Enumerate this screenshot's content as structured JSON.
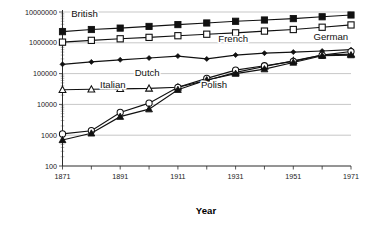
{
  "chart_data": {
    "type": "line",
    "title": "",
    "xlabel": "Year",
    "ylabel": "",
    "yscale": "log",
    "ylim": [
      100,
      10000000
    ],
    "xlim": [
      1871,
      1971
    ],
    "grid": true,
    "legend_position": "inline-labels",
    "x": [
      1871,
      1881,
      1891,
      1901,
      1911,
      1921,
      1931,
      1941,
      1951,
      1961,
      1971
    ],
    "ytick_labels": [
      "100",
      "1000",
      "10000",
      "100000",
      "1000000",
      "10000000"
    ],
    "ytick_values": [
      100,
      1000,
      10000,
      100000,
      1000000,
      10000000
    ],
    "xtick_labels": [
      "1871",
      "1891",
      "1911",
      "1931",
      "1951",
      "1971"
    ],
    "xtick_values": [
      1871,
      1891,
      1911,
      1931,
      1951,
      1971
    ],
    "series": [
      {
        "name": "British",
        "marker": "filled-square",
        "values": [
          2300000,
          2700000,
          3000000,
          3400000,
          3900000,
          4400000,
          5000000,
          5500000,
          6100000,
          7000000,
          8000000
        ]
      },
      {
        "name": "French",
        "marker": "open-square",
        "values": [
          1050000,
          1200000,
          1350000,
          1500000,
          1700000,
          1900000,
          2100000,
          2400000,
          2700000,
          3200000,
          3800000
        ]
      },
      {
        "name": "German",
        "marker": "small-filled-diamond",
        "values": [
          200000,
          240000,
          280000,
          320000,
          370000,
          300000,
          400000,
          460000,
          500000,
          540000,
          600000
        ]
      },
      {
        "name": "Dutch",
        "marker": "open-triangle",
        "values": [
          30000,
          31000,
          32000,
          33000,
          36000,
          60000,
          110000,
          170000,
          260000,
          400000,
          430000
        ]
      },
      {
        "name": "Polish",
        "marker": "open-circle",
        "values": [
          1100,
          1400,
          5500,
          11000,
          36000,
          70000,
          130000,
          180000,
          250000,
          400000,
          520000
        ]
      },
      {
        "name": "Italian",
        "marker": "filled-triangle",
        "values": [
          700,
          1150,
          4000,
          7000,
          30000,
          62000,
          100000,
          140000,
          230000,
          380000,
          400000
        ]
      }
    ],
    "annotations": [
      {
        "text": "British",
        "x": 1874,
        "y": 6800000
      },
      {
        "text": "French",
        "x": 1925,
        "y": 1100000
      },
      {
        "text": "German",
        "x": 1958,
        "y": 1250000
      },
      {
        "text": "Dutch",
        "x": 1896,
        "y": 85000
      },
      {
        "text": "Italian",
        "x": 1884,
        "y": 33000
      },
      {
        "text": "Polish",
        "x": 1919,
        "y": 33000
      }
    ]
  }
}
